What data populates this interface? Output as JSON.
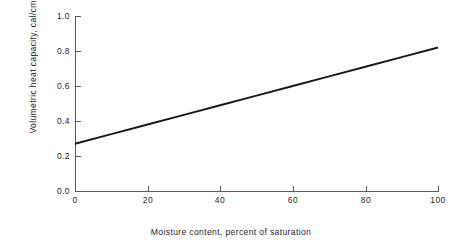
{
  "chart_data": {
    "type": "line",
    "title": "",
    "xlabel": "Moisture content, percent of saturation",
    "ylabel": "Volumetric heat capacity, cal/cm",
    "ylabel_superscript": "3",
    "ylabel_full": "Volumetric heat capacity, cal/cm3",
    "xlim": [
      0,
      100
    ],
    "ylim": [
      0.0,
      1.0
    ],
    "grid": false,
    "legend": "none",
    "x_ticks": [
      0,
      20,
      40,
      60,
      80,
      100
    ],
    "x_tick_labels": [
      "0",
      "20",
      "40",
      "60",
      "80",
      "100"
    ],
    "y_ticks": [
      0.0,
      0.2,
      0.4,
      0.6,
      0.8,
      1.0
    ],
    "y_tick_labels": [
      "0.0",
      "0.2",
      "0.4",
      "0.6",
      "0.8",
      "1.0"
    ],
    "series": [
      {
        "name": "Volumetric heat capacity",
        "color": "#1a1a1a",
        "line_width": 2,
        "x": [
          0,
          10,
          20,
          30,
          40,
          50,
          60,
          70,
          80,
          90,
          100
        ],
        "values": [
          0.27,
          0.325,
          0.38,
          0.435,
          0.49,
          0.545,
          0.6,
          0.655,
          0.71,
          0.765,
          0.82
        ]
      }
    ]
  },
  "style": {
    "background": "#ffffff",
    "axis_color": "#5b5b5b",
    "text_color": "#1f1f1f",
    "line_color": "#1a1a1a"
  }
}
